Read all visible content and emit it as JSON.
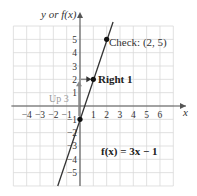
{
  "chart_data": {
    "type": "line",
    "title": "",
    "xlabel": "x",
    "ylabel": "y or f(x)",
    "xlim": [
      -5,
      7
    ],
    "ylim": [
      -6,
      6
    ],
    "grid": true,
    "x_ticks": [
      "-4",
      "-3",
      "-2",
      "-1",
      "1",
      "2",
      "3",
      "4",
      "5",
      "6"
    ],
    "y_ticks": [
      "5",
      "4",
      "3",
      "2",
      "1",
      "-1",
      "-2",
      "-3",
      "-4",
      "-5"
    ],
    "series": [
      {
        "name": "f(x) = 3x - 1",
        "equation": "f(x) = 3x - 1",
        "slope": 3,
        "intercept": -1,
        "x": [
          -1.67,
          2.33
        ],
        "y": [
          -6,
          6
        ]
      }
    ],
    "points": [
      {
        "label": "y-intercept",
        "x": 0,
        "y": -1
      },
      {
        "label": "Right 1",
        "x": 1,
        "y": 2
      },
      {
        "label": "Check: (2, 5)",
        "x": 2,
        "y": 5
      }
    ],
    "annotations": [
      {
        "text": "Up 3",
        "from": [
          0,
          -1
        ],
        "to": [
          0,
          2
        ],
        "direction": "up"
      },
      {
        "text": "Right 1",
        "from": [
          0,
          2
        ],
        "to": [
          1,
          2
        ],
        "direction": "right"
      },
      {
        "text": "Check: (2, 5)",
        "at": [
          2,
          5
        ]
      },
      {
        "text": "f(x) = 3x − 1",
        "position": "lower-right"
      }
    ]
  },
  "labels": {
    "y_axis": "y or f(x)",
    "x_axis": "x",
    "check": "Check: (2, 5)",
    "right": "Right 1",
    "up": "Up 3",
    "equation": "f(x) = 3x − 1"
  },
  "colors": {
    "grid": "#d9d9d9",
    "axis": "#555555",
    "line": "#333333",
    "arrow": "#888888",
    "point": "#111111"
  }
}
